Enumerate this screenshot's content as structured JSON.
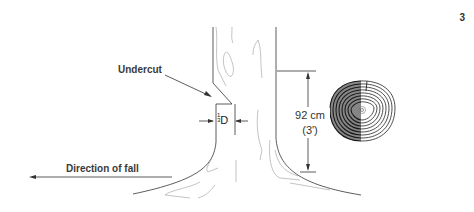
{
  "page_number": "3",
  "labels": {
    "undercut": "Undercut",
    "direction_of_fall": "Direction of fall",
    "fraction_num": "1",
    "fraction_den": "3",
    "fraction_var": "D",
    "height_metric": "92 cm",
    "height_imperial": "(3')"
  },
  "colors": {
    "line_dark": "#333333",
    "line_light": "#9a9a9a",
    "text": "#3a3a3a"
  },
  "icons": {
    "stump_rings": "tree-ring-cross-section-icon",
    "arrow_left": "arrow-left-icon"
  }
}
